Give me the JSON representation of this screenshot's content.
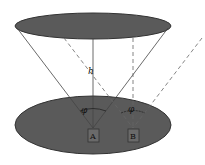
{
  "diagram": {
    "height_label": "h",
    "angle_label_a": "φ",
    "angle_label_a_sub": "",
    "angle_label_b": "φ",
    "angle_label_b_sub": "",
    "box_a_label": "A",
    "box_b_label": "B",
    "colors": {
      "ellipse_fill": "#5a5a5a",
      "ellipse_stroke": "#333333",
      "line": "#444444",
      "dashed_line": "#666666",
      "box_stroke": "#333333"
    }
  }
}
